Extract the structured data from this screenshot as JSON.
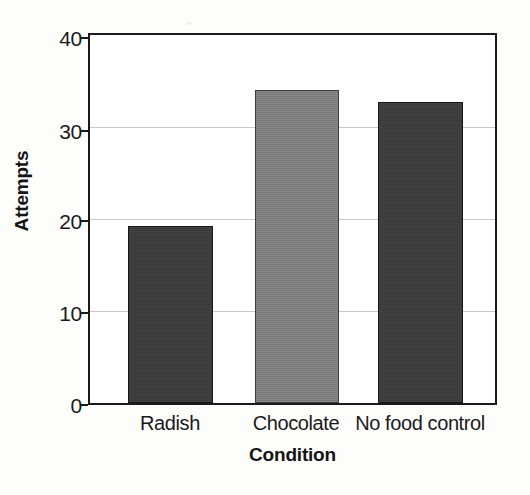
{
  "chart_data": {
    "type": "bar",
    "title": "",
    "categories": [
      "Radish",
      "Chocolate",
      "No food control"
    ],
    "values": [
      19.2,
      34.0,
      32.7
    ],
    "series": [
      {
        "name": "Attempts",
        "values": [
          19.2,
          34.0,
          32.7
        ]
      }
    ],
    "xlabel": "Condition",
    "ylabel": "Attempts",
    "ylim": [
      0,
      40
    ],
    "yticks": [
      0,
      10,
      20,
      30,
      40
    ],
    "ytick_labels": [
      "0",
      "10",
      "20",
      "30",
      "40"
    ],
    "grid": true,
    "gridlines_at": [
      10,
      20,
      30
    ],
    "legend": false,
    "legend_position": "none",
    "bar_colors": [
      "#3a3a3a",
      "#7d7d7d",
      "#3a3a3a"
    ],
    "frame_color": "#1a1a1a",
    "gridline_color": "#c9c9c9",
    "background": "#ffffff"
  }
}
